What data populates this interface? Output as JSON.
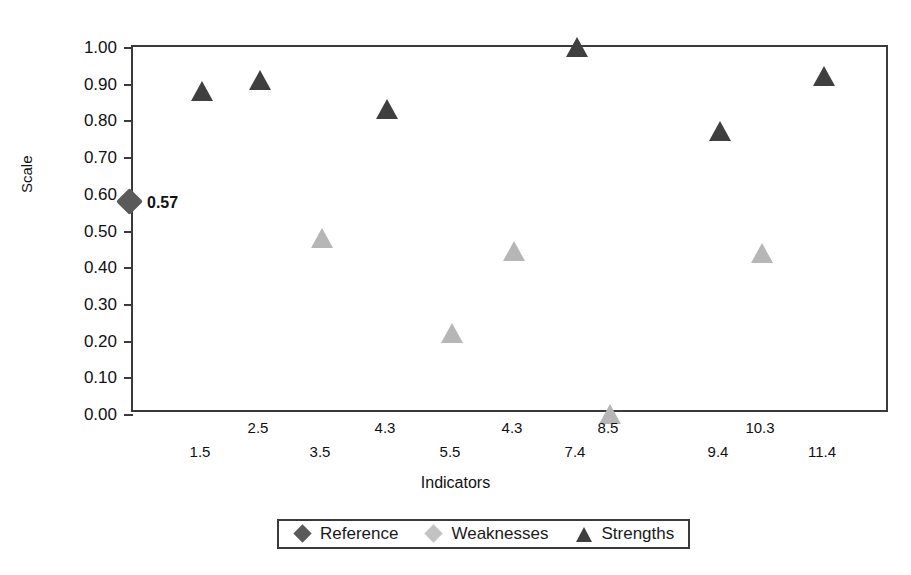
{
  "chart_data": {
    "type": "scatter",
    "title": "",
    "xlabel": "Indicators",
    "ylabel": "Scale",
    "ylim": [
      0.0,
      1.0
    ],
    "ytick_labels": [
      "1.00",
      "0.90",
      "0.80",
      "0.70",
      "0.60",
      "0.50",
      "0.40",
      "0.30",
      "0.20",
      "0.10",
      "0.00"
    ],
    "ytick_values": [
      1.0,
      0.9,
      0.8,
      0.7,
      0.6,
      0.5,
      0.4,
      0.3,
      0.2,
      0.1,
      0.0
    ],
    "xtick_labels": [
      "1.5",
      "2.5",
      "3.5",
      "4.3",
      "5.5",
      "4.3",
      "7.4",
      "8.5",
      "9.4",
      "10.3",
      "11.4"
    ],
    "grid": false,
    "legend_position": "bottom",
    "legend": [
      "Reference",
      "Weaknesses",
      "Strengths"
    ],
    "annotations": [
      {
        "text": "0.57",
        "series": "Reference",
        "value": 0.57
      }
    ],
    "series": [
      {
        "name": "Reference",
        "marker": "diamond",
        "color": "#5a5a5a",
        "points": [
          {
            "category": "",
            "value": 0.57,
            "label": "0.57"
          }
        ]
      },
      {
        "name": "Weaknesses",
        "marker": "triangle",
        "color": "#b6b6b6",
        "points": [
          {
            "category": "3.5",
            "value": 0.48
          },
          {
            "category": "5.5",
            "value": 0.22
          },
          {
            "category": "4.3",
            "value": 0.445
          },
          {
            "category": "8.5",
            "value": 0.0
          },
          {
            "category": "10.3",
            "value": 0.44
          }
        ]
      },
      {
        "name": "Strengths",
        "marker": "triangle",
        "color": "#3f3f3f",
        "points": [
          {
            "category": "1.5",
            "value": 0.88
          },
          {
            "category": "2.5",
            "value": 0.91
          },
          {
            "category": "4.3",
            "value": 0.83
          },
          {
            "category": "7.4",
            "value": 1.0
          },
          {
            "category": "9.4",
            "value": 0.77
          },
          {
            "category": "11.4",
            "value": 0.92
          }
        ]
      }
    ]
  },
  "figure": {
    "title_clipped": "",
    "y_axis_title": "Scale",
    "x_axis_title": "Indicators"
  },
  "y_axis": {
    "ticks": [
      {
        "label": "1.00",
        "value": 1.0
      },
      {
        "label": "0.90",
        "value": 0.9
      },
      {
        "label": "0.80",
        "value": 0.8
      },
      {
        "label": "0.70",
        "value": 0.7
      },
      {
        "label": "0.60",
        "value": 0.6
      },
      {
        "label": "0.50",
        "value": 0.5
      },
      {
        "label": "0.40",
        "value": 0.4
      },
      {
        "label": "0.30",
        "value": 0.3
      },
      {
        "label": "0.20",
        "value": 0.2
      },
      {
        "label": "0.10",
        "value": 0.1
      },
      {
        "label": "0.00",
        "value": 0.0
      }
    ]
  },
  "x_axis": {
    "ticks": [
      {
        "label": "1.5",
        "px": 200,
        "row": "bot"
      },
      {
        "label": "2.5",
        "px": 258,
        "row": "top"
      },
      {
        "label": "3.5",
        "px": 320,
        "row": "bot"
      },
      {
        "label": "4.3",
        "px": 385,
        "row": "top"
      },
      {
        "label": "5.5",
        "px": 450,
        "row": "bot"
      },
      {
        "label": "4.3",
        "px": 512,
        "row": "top"
      },
      {
        "label": "7.4",
        "px": 575,
        "row": "bot"
      },
      {
        "label": "8.5",
        "px": 608,
        "row": "top"
      },
      {
        "label": "9.4",
        "px": 718,
        "row": "bot"
      },
      {
        "label": "10.3",
        "px": 760,
        "row": "top"
      },
      {
        "label": "11.4",
        "px": 822,
        "row": "bot"
      }
    ]
  },
  "markers": [
    {
      "name": "reference-0.57",
      "series": "Reference",
      "shape": "diamond",
      "px": 131,
      "value": 0.57,
      "label": "0.57"
    },
    {
      "name": "strength-1.5",
      "series": "Strengths",
      "shape": "triangle",
      "px": 200,
      "value": 0.88,
      "label": ""
    },
    {
      "name": "strength-2.5",
      "series": "Strengths",
      "shape": "triangle",
      "px": 258,
      "value": 0.91,
      "label": ""
    },
    {
      "name": "weakness-3.5",
      "series": "Weaknesses",
      "shape": "triangle",
      "px": 320,
      "value": 0.48,
      "label": ""
    },
    {
      "name": "strength-4.3",
      "series": "Strengths",
      "shape": "triangle",
      "px": 385,
      "value": 0.83,
      "label": ""
    },
    {
      "name": "weakness-5.5",
      "series": "Weaknesses",
      "shape": "triangle",
      "px": 450,
      "value": 0.22,
      "label": ""
    },
    {
      "name": "weakness-4.3",
      "series": "Weaknesses",
      "shape": "triangle",
      "px": 512,
      "value": 0.445,
      "label": ""
    },
    {
      "name": "strength-7.4",
      "series": "Strengths",
      "shape": "triangle",
      "px": 575,
      "value": 1.0,
      "label": ""
    },
    {
      "name": "weakness-8.5",
      "series": "Weaknesses",
      "shape": "triangle",
      "px": 608,
      "value": 0.0,
      "label": ""
    },
    {
      "name": "strength-9.4",
      "series": "Strengths",
      "shape": "triangle",
      "px": 718,
      "value": 0.77,
      "label": ""
    },
    {
      "name": "weakness-10.3",
      "series": "Weaknesses",
      "shape": "triangle",
      "px": 760,
      "value": 0.44,
      "label": ""
    },
    {
      "name": "strength-11.4",
      "series": "Strengths",
      "shape": "triangle",
      "px": 822,
      "value": 0.92,
      "label": ""
    }
  ],
  "legend": {
    "entries": [
      {
        "label": "Reference",
        "shape": "diamond",
        "tone": "dark"
      },
      {
        "label": "Weaknesses",
        "shape": "diamond",
        "tone": "light"
      },
      {
        "label": "Strengths",
        "shape": "triangle",
        "tone": "dark"
      }
    ]
  },
  "colors": {
    "strengths": "#3f3f3f",
    "weaknesses": "#b6b6b6",
    "reference": "#5a5a5a",
    "axis": "#3a3a3a",
    "background": "#ffffff"
  }
}
